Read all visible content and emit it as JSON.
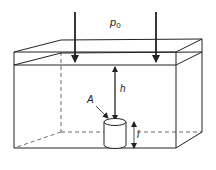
{
  "diagram": {
    "labels": {
      "pressure": "p",
      "pressure_subscript": "0",
      "depth": "h",
      "area": "A",
      "length": "l"
    },
    "colors": {
      "line": "#222222",
      "background": "#ffffff"
    }
  }
}
